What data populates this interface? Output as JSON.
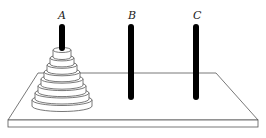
{
  "diagram": {
    "pegs": [
      {
        "id": "A",
        "label": "A",
        "x": 62,
        "disk_count": 8
      },
      {
        "id": "B",
        "label": "B",
        "x": 131,
        "disk_count": 0
      },
      {
        "id": "C",
        "label": "C",
        "x": 196,
        "disk_count": 0
      }
    ],
    "disks": [
      {
        "index": 1,
        "half_width": 9
      },
      {
        "index": 2,
        "half_width": 12
      },
      {
        "index": 3,
        "half_width": 15
      },
      {
        "index": 4,
        "half_width": 18
      },
      {
        "index": 5,
        "half_width": 21
      },
      {
        "index": 6,
        "half_width": 24
      },
      {
        "index": 7,
        "half_width": 27
      },
      {
        "index": 8,
        "half_width": 30
      }
    ],
    "colors": {
      "peg": "#000000",
      "outline": "#555555",
      "board_fill": "#ffffff",
      "disk_fill": "#ffffff"
    }
  }
}
